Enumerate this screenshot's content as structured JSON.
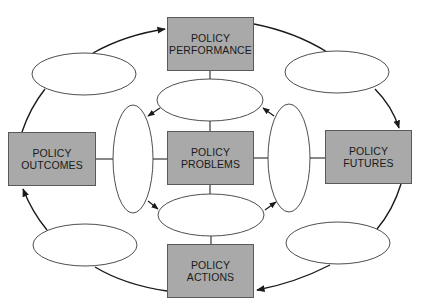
{
  "diagram": {
    "type": "policy-analysis-cycle",
    "nodes": {
      "performance": {
        "line1": "POLICY",
        "line2": "PERFORMANCE"
      },
      "outcomes": {
        "line1": "POLICY",
        "line2": "OUTCOMES"
      },
      "problems": {
        "line1": "POLICY",
        "line2": "PROBLEMS"
      },
      "futures": {
        "line1": "POLICY",
        "line2": "FUTURES"
      },
      "actions": {
        "line1": "POLICY",
        "line2": "ACTIONS"
      }
    },
    "empty_ellipses": [
      "outer-top-left",
      "outer-top-right",
      "outer-bottom-left",
      "outer-bottom-right",
      "inner-top",
      "inner-left",
      "inner-right",
      "inner-bottom"
    ],
    "outer_cycle_order": [
      "POLICY OUTCOMES",
      "POLICY PERFORMANCE",
      "POLICY FUTURES",
      "POLICY ACTIONS",
      "POLICY OUTCOMES"
    ],
    "colors": {
      "box_fill": "#a9a9a9",
      "box_border": "#5a5a5a",
      "line": "#1a1a1a",
      "ellipse_fill": "#ffffff"
    }
  }
}
